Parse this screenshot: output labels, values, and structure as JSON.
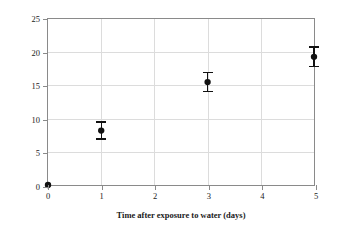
{
  "chart_data": {
    "type": "scatter",
    "title": "",
    "xlabel": "Time after exposure to water (days)",
    "ylabel": "Rate of respiration (μL O₂/min)",
    "ylabel_parts": {
      "prefix": "Rate of respiration (μL O",
      "subscript": "2",
      "suffix": "/min)"
    },
    "xlim": [
      0,
      5
    ],
    "ylim": [
      0,
      25
    ],
    "xticks": [
      0,
      1,
      2,
      3,
      4,
      5
    ],
    "xtick_labels": [
      "0",
      "1",
      "2",
      "3",
      "4",
      "5"
    ],
    "yticks": [
      0,
      5,
      10,
      15,
      20,
      25
    ],
    "ytick_labels": [
      "0",
      "5",
      "10",
      "15",
      "20",
      "25"
    ],
    "grid": true,
    "grid_color": "#dcdcdc",
    "frame_color": "#8a8a8a",
    "background_color": "#ffffff",
    "marker_color": "#111111",
    "legend": null,
    "legend_position": "none",
    "x": [
      0,
      1,
      3,
      5
    ],
    "y": [
      0,
      8.2,
      15.5,
      19.3
    ],
    "yerr": [
      0,
      1.3,
      1.4,
      1.5
    ],
    "points": [
      {
        "label": "day-0",
        "x": 0,
        "y": 0,
        "yerr": 0,
        "y_low": 0,
        "y_high": 0
      },
      {
        "label": "day-1",
        "x": 1,
        "y": 8.2,
        "yerr": 1.3,
        "y_low": 6.9,
        "y_high": 9.5
      },
      {
        "label": "day-3",
        "x": 3,
        "y": 15.5,
        "yerr": 1.4,
        "y_low": 14.1,
        "y_high": 16.9
      },
      {
        "label": "day-5",
        "x": 5,
        "y": 19.3,
        "yerr": 1.5,
        "y_low": 17.8,
        "y_high": 20.8
      }
    ]
  }
}
